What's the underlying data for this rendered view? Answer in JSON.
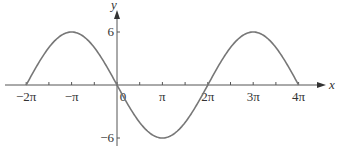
{
  "chart_data": {
    "type": "line",
    "title": "",
    "function": "y = -6 sin(x/2)",
    "xlabel": "x",
    "ylabel": "y",
    "xlim": [
      -6.2832,
      12.5664
    ],
    "ylim": [
      -6,
      6
    ],
    "grid": false,
    "legend": null,
    "x_ticks": [
      {
        "value": -6.2832,
        "label": "−2π"
      },
      {
        "value": -3.1416,
        "label": "−π"
      },
      {
        "value": 0,
        "label": "0"
      },
      {
        "value": 3.1416,
        "label": "π"
      },
      {
        "value": 6.2832,
        "label": "2π"
      },
      {
        "value": 9.4248,
        "label": "3π"
      },
      {
        "value": 12.5664,
        "label": "4π"
      }
    ],
    "y_ticks": [
      {
        "value": 6,
        "label": "6"
      },
      {
        "value": -6,
        "label": "−6"
      }
    ],
    "series": [
      {
        "name": "curve",
        "color": "#777777",
        "x": [
          -6.2832,
          -4.7124,
          -3.1416,
          -1.5708,
          0,
          1.5708,
          3.1416,
          4.7124,
          6.2832,
          7.854,
          9.4248,
          10.9956,
          12.5664
        ],
        "y": [
          0,
          4.24,
          6,
          4.24,
          0,
          -4.24,
          -6,
          -4.24,
          0,
          4.24,
          6,
          4.24,
          0
        ]
      }
    ]
  },
  "axes": {
    "x_label": "x",
    "y_label": "y",
    "tick_labels_x": [
      "−2π",
      "−π",
      "0",
      "π",
      "2π",
      "3π",
      "4π"
    ],
    "tick_labels_y": [
      "6",
      "−6"
    ]
  }
}
